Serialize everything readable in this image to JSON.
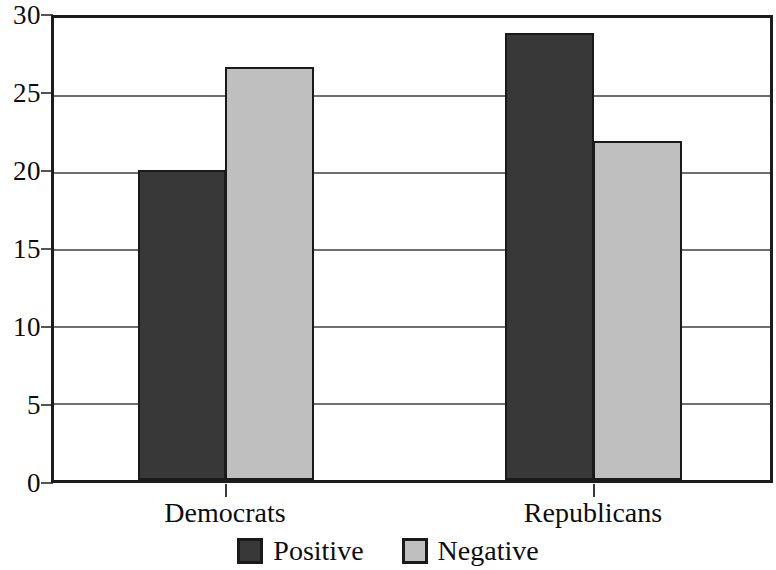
{
  "chart_data": {
    "type": "bar",
    "title": "",
    "subtitle": "",
    "xlabel": "",
    "ylabel": "",
    "categories": [
      "Democrats",
      "Republicans"
    ],
    "series": [
      {
        "name": "Positive",
        "color": "#383838",
        "values": [
          20.1,
          29.0
        ]
      },
      {
        "name": "Negative",
        "color": "#bfbfbf",
        "values": [
          26.8,
          22.0
        ]
      }
    ],
    "ylim": [
      0,
      30
    ],
    "yticks": [
      0,
      5,
      10,
      15,
      20,
      25,
      30
    ],
    "ytick_labels": [
      "0",
      "5",
      "10",
      "15",
      "20",
      "25",
      "30"
    ],
    "grid": true,
    "grid_axis": "y",
    "legend_position": "bottom",
    "legend_entries": [
      "Positive",
      "Negative"
    ],
    "bar_mode": "grouped",
    "frame": true
  },
  "axis": {
    "y_labels": [
      "30",
      "25",
      "20",
      "15",
      "10",
      "5",
      "0"
    ]
  },
  "categories": {
    "labels": [
      "Democrats",
      "Republicans"
    ]
  },
  "legend": {
    "items": [
      {
        "label": "Positive",
        "swatch": "dark-square-swatch"
      },
      {
        "label": "Negative",
        "swatch": "light-square-swatch"
      }
    ]
  },
  "colors": {
    "positive": "#383838",
    "negative": "#bfbfbf",
    "axis": "#1c1c1c",
    "grid": "#6e6e6e",
    "background": "#ffffff"
  }
}
